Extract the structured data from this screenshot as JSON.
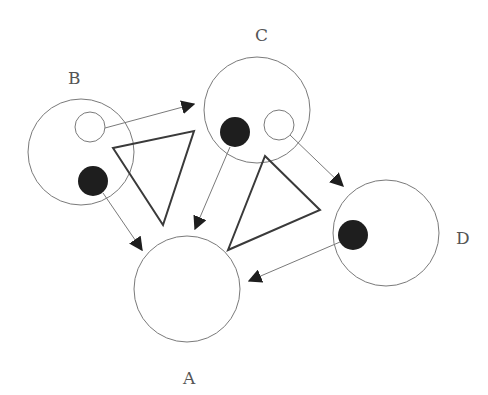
{
  "colors": {
    "outline": "#7a7a7a",
    "fill": "#1e1e1e",
    "triangle": "#3a3a3a"
  },
  "nodes": [
    {
      "id": "B",
      "label": "B"
    },
    {
      "id": "C",
      "label": "C"
    },
    {
      "id": "D",
      "label": "D"
    },
    {
      "id": "A",
      "label": "A"
    }
  ],
  "edges": [
    {
      "from": "B-open-dot",
      "to": "C"
    },
    {
      "from": "B-filled-dot",
      "to": "A"
    },
    {
      "from": "C-filled-dot",
      "to": "A"
    },
    {
      "from": "C-open-dot",
      "to": "D"
    },
    {
      "from": "D-filled-dot",
      "to": "A"
    }
  ],
  "triangles": 2
}
